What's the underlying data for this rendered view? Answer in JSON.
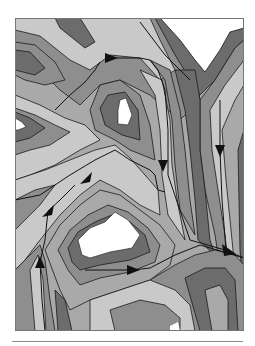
{
  "figure": {
    "type": "contour-flow-diagram",
    "frame": {
      "x": 15,
      "y": 18,
      "width": 229,
      "height": 313
    },
    "palette": {
      "peak": "#ffffff",
      "band_light": "#c9c9c9",
      "band_midlight": "#a9a9a9",
      "band_mid": "#8e8e8e",
      "band_dark": "#6c6c6c",
      "line": "#1a1a1a",
      "frame": "#777777"
    },
    "arrows": [
      {
        "id": "arrow-top-center",
        "x": 113,
        "y": 58,
        "direction": "right"
      },
      {
        "id": "arrow-center-right",
        "x": 163,
        "y": 165,
        "direction": "down"
      },
      {
        "id": "arrow-right-edge",
        "x": 220,
        "y": 150,
        "direction": "down"
      },
      {
        "id": "arrow-center-left",
        "x": 86,
        "y": 178,
        "direction": "up-left"
      },
      {
        "id": "arrow-left-mid",
        "x": 48,
        "y": 211,
        "direction": "up-left"
      },
      {
        "id": "arrow-lower-right",
        "x": 229,
        "y": 250,
        "direction": "down-right"
      },
      {
        "id": "arrow-lower-left",
        "x": 40,
        "y": 262,
        "direction": "up"
      },
      {
        "id": "arrow-bottom-center",
        "x": 133,
        "y": 270,
        "direction": "right"
      }
    ]
  }
}
